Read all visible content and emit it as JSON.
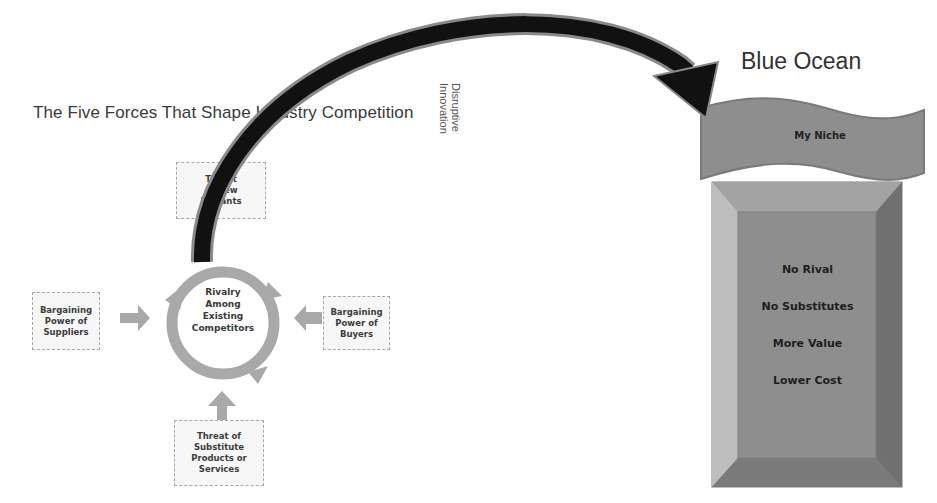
{
  "diagram": {
    "title": "The Five Forces That Shape Industry Competition",
    "connector_label": {
      "line1": "Disruptive",
      "line2": "Innovation"
    },
    "five_forces": {
      "center": "Rivalry\nAmong\nExisting\nCompetitors",
      "top": "Threat\nof New\nEntrants",
      "left": "Bargaining\nPower of\nSuppliers",
      "right": "Bargaining\nPower of\nBuyers",
      "bottom": "Threat of\nSubstitute\nProducts or\nServices"
    },
    "blue_ocean": {
      "title": "Blue Ocean",
      "banner": "My Niche",
      "items": [
        "No Rival",
        "No Substitutes",
        "More Value",
        "Lower Cost"
      ]
    },
    "colors": {
      "arrow": "#111111",
      "arrow_outline": "#8a8a8a",
      "force_arrows": "#a9a9a9",
      "box_fill": "#f7f7f7",
      "banner_fill": "#8e8e8e",
      "bevel_face": "#8c8c8c",
      "bevel_light": "#b8b8b8",
      "bevel_dark": "#6e6e6e"
    }
  }
}
